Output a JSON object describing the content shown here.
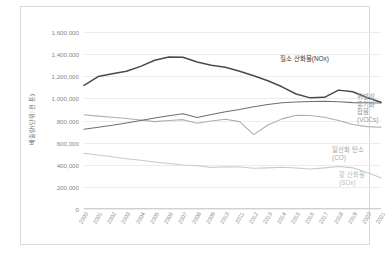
{
  "chart_data": {
    "type": "line",
    "title": "",
    "xlabel": "",
    "ylabel": "배출량(단위: 천 톤)",
    "ylim": [
      0,
      1700000
    ],
    "yticks": [
      0,
      200000,
      400000,
      600000,
      800000,
      1000000,
      1200000,
      1400000,
      1600000
    ],
    "ytick_labels": [
      "0",
      "200,000",
      "400,000",
      "600,000",
      "800,000",
      "1,000,000",
      "1,200,000",
      "1,400,000",
      "1,600,000"
    ],
    "grid": true,
    "legend_position": "inline-annotations",
    "categories": [
      "2000",
      "2001",
      "2002",
      "2003",
      "2004",
      "2005",
      "2006",
      "2007",
      "2008",
      "2009",
      "2010",
      "2011",
      "2012",
      "2013",
      "2014",
      "2015",
      "2016",
      "2017",
      "2018",
      "2019",
      "2020",
      "2021"
    ],
    "series": [
      {
        "name": "질소 산화물(NOx)",
        "color": "#4a4a4a",
        "values": [
          1118000,
          1198000,
          1222000,
          1245000,
          1290000,
          1345000,
          1375000,
          1372000,
          1330000,
          1300000,
          1282000,
          1245000,
          1205000,
          1160000,
          1105000,
          1040000,
          1005000,
          1010000,
          1075000,
          1060000,
          1008000,
          965000
        ]
      },
      {
        "name": "휘발성\n유기화합물\n(VOCs)",
        "color": "#6e6e6e",
        "values": [
          722000,
          740000,
          757000,
          778000,
          800000,
          822000,
          843000,
          862000,
          828000,
          855000,
          880000,
          900000,
          925000,
          945000,
          960000,
          968000,
          972000,
          975000,
          970000,
          962000,
          960000,
          958000
        ]
      },
      {
        "name": "일산화 탄소(CO)",
        "color": "#adadad",
        "values": [
          852000,
          840000,
          830000,
          818000,
          805000,
          790000,
          800000,
          808000,
          775000,
          795000,
          812000,
          790000,
          672000,
          760000,
          815000,
          848000,
          845000,
          830000,
          800000,
          765000,
          745000,
          740000
        ]
      },
      {
        "name": "황 산화물(SOx)",
        "color": "#c9c9c9",
        "values": [
          505000,
          488000,
          472000,
          455000,
          440000,
          425000,
          412000,
          398000,
          392000,
          375000,
          382000,
          380000,
          368000,
          372000,
          378000,
          370000,
          362000,
          372000,
          385000,
          372000,
          330000,
          282000
        ]
      }
    ]
  }
}
